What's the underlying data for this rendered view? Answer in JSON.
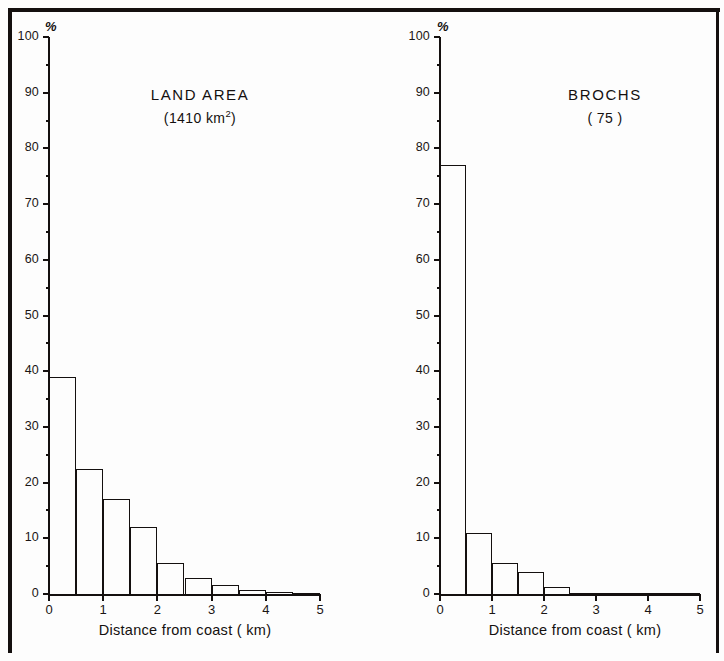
{
  "figure": {
    "panels": [
      "land_area",
      "brochs"
    ],
    "axis_title": "Distance from coast ( km)",
    "percent_symbol": "%",
    "y_ticks": [
      "0",
      "10",
      "20",
      "30",
      "40",
      "50",
      "60",
      "70",
      "80",
      "90",
      "100"
    ],
    "x_ticks": [
      "0",
      "1",
      "2",
      "3",
      "4",
      "5"
    ]
  },
  "chart_data": [
    {
      "type": "bar",
      "id": "land_area",
      "title": "LAND  AREA",
      "subtitle_prefix": "(1410 km",
      "subtitle_sup": "2",
      "subtitle_suffix": ")",
      "subtitle_plain": "(1410 km2)",
      "xlabel": "Distance from coast ( km)",
      "ylabel": "%",
      "xlim": [
        0,
        5
      ],
      "ylim": [
        0,
        100
      ],
      "grid": false,
      "legend": "none",
      "bin_width": 0.5,
      "bin_starts": [
        0,
        0.5,
        1,
        1.5,
        2,
        2.5,
        3,
        3.5,
        4,
        4.5
      ],
      "categories": [
        "0-0.5",
        "0.5-1",
        "1-1.5",
        "1.5-2",
        "2-2.5",
        "2.5-3",
        "3-3.5",
        "3.5-4",
        "4-4.5",
        "4.5-5"
      ],
      "values": [
        39,
        22.5,
        17,
        12,
        5.5,
        2.8,
        1.6,
        0.8,
        0.3,
        0.2
      ]
    },
    {
      "type": "bar",
      "id": "brochs",
      "title": "BROCHS",
      "subtitle_prefix": "( 75 )",
      "subtitle_sup": "",
      "subtitle_suffix": "",
      "subtitle_plain": "( 75 )",
      "xlabel": "Distance from coast ( km)",
      "ylabel": "%",
      "xlim": [
        0,
        5
      ],
      "ylim": [
        0,
        100
      ],
      "grid": false,
      "legend": "none",
      "bin_width": 0.5,
      "bin_starts": [
        0,
        0.5,
        1,
        1.5,
        2,
        2.5,
        3,
        3.5,
        4,
        4.5
      ],
      "categories": [
        "0-0.5",
        "0.5-1",
        "1-1.5",
        "1.5-2",
        "2-2.5",
        "2.5-3",
        "3-3.5",
        "3.5-4",
        "4-4.5",
        "4.5-5"
      ],
      "values": [
        77,
        11,
        5.5,
        4,
        1.2,
        0,
        0,
        0,
        0,
        0
      ]
    }
  ]
}
